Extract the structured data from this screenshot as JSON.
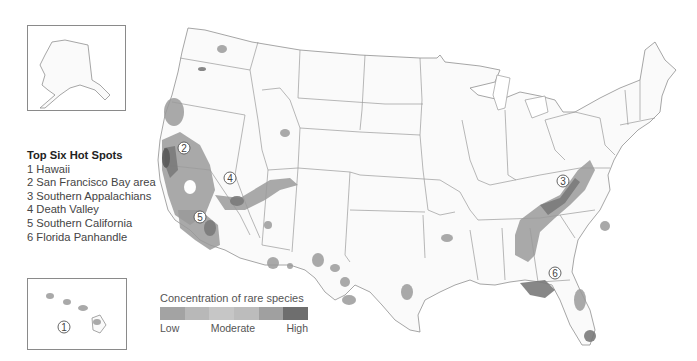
{
  "legend": {
    "title": "Top Six Hot Spots",
    "items": [
      "1 Hawaii",
      "2 San Francisco Bay area",
      "3 Southern Appalachians",
      "4 Death Valley",
      "5 Southern California",
      "6 Florida Panhandle"
    ]
  },
  "scale": {
    "title": "Concentration of rare species",
    "labels": {
      "low": "Low",
      "moderate": "Moderate",
      "high": "High"
    },
    "colors": [
      "#a3a3a3",
      "#b8b8b8",
      "#c6c6c6",
      "#bcbcbc",
      "#a0a0a0",
      "#6e6e6e"
    ]
  },
  "markers": [
    {
      "id": "1",
      "label": "1"
    },
    {
      "id": "2",
      "label": "2"
    },
    {
      "id": "3",
      "label": "3"
    },
    {
      "id": "4",
      "label": "4"
    },
    {
      "id": "5",
      "label": "5"
    },
    {
      "id": "6",
      "label": "6"
    }
  ],
  "insets": {
    "alaska": "Alaska",
    "hawaii": "Hawaii"
  }
}
